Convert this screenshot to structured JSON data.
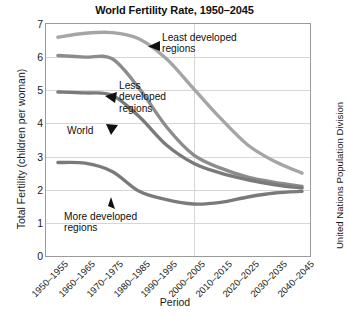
{
  "chart_data": {
    "type": "line",
    "title": "World Fertility Rate, 1950–2045",
    "xlabel": "Period",
    "ylabel": "Total Fertility (children per woman)",
    "credit": "United Nations Population Division",
    "categories": [
      "1950–1955",
      "1960–1965",
      "1970–1975",
      "1980–1985",
      "1990–1995",
      "2000–2005",
      "2010–2015",
      "2020–2025",
      "2030–2035",
      "2040–2045"
    ],
    "ylim": [
      0,
      7
    ],
    "yticks": [
      "0",
      "1",
      "2",
      "3",
      "4",
      "5",
      "6",
      "7"
    ],
    "grid": "horizontal gridlines at each integer, one vertical gridline at 2000-2005",
    "legend_position": "inline annotations with arrows",
    "series": [
      {
        "name": "Least developed regions",
        "color": "#a5a5a5",
        "values": [
          6.6,
          6.72,
          6.74,
          6.55,
          5.95,
          5.05,
          4.15,
          3.35,
          2.85,
          2.5
        ]
      },
      {
        "name": "Less developed regions",
        "color": "#8c8c8c",
        "values": [
          6.05,
          6.0,
          5.95,
          5.05,
          3.9,
          3.05,
          2.65,
          2.38,
          2.22,
          2.1
        ]
      },
      {
        "name": "World",
        "color": "#7a7a7a",
        "values": [
          4.95,
          4.92,
          4.85,
          4.2,
          3.35,
          2.8,
          2.5,
          2.3,
          2.15,
          2.05
        ]
      },
      {
        "name": "More developed regions",
        "color": "#7a7a7a",
        "values": [
          2.82,
          2.8,
          2.55,
          1.95,
          1.7,
          1.57,
          1.62,
          1.78,
          1.9,
          1.95
        ]
      }
    ],
    "annotations": [
      {
        "label": "Least developed\nregions",
        "target_series": "Least developed regions"
      },
      {
        "label": "Less\ndeveloped\nregions",
        "target_series": "Less developed regions"
      },
      {
        "label": "World",
        "target_series": "World"
      },
      {
        "label": "More developed\nregions",
        "target_series": "More developed regions"
      }
    ]
  }
}
